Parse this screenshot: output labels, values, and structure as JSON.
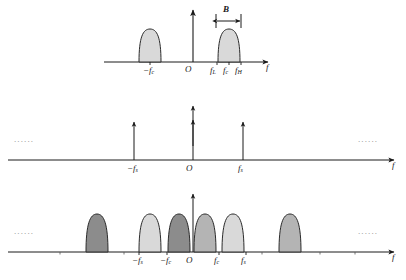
{
  "figure": {
    "axis_label": "f",
    "origin_label": "O",
    "bandwidth_label": "B",
    "ellipsis": "......",
    "colors": {
      "axis": "#1a1a1a",
      "outline": "#2b2b2b",
      "lobe_light": "#d9d9d9",
      "lobe_mid": "#b4b4b4",
      "lobe_dark": "#8c8c8c",
      "ellipsis": "#8a8a8a",
      "background": "#ffffff"
    }
  },
  "panels": [
    {
      "name": "signal-spectrum",
      "baseline_y": 62,
      "axis_from_x": 104,
      "axis_to_x": 272,
      "vaxis_x": 193,
      "vaxis_top_y": 8,
      "axis_label": "f",
      "origin_label": "O",
      "bandwidth": {
        "label": "B",
        "from_x": 216,
        "to_x": 241,
        "y": 20
      },
      "lobes": [
        {
          "name": "negative-lobe",
          "center_x": 150,
          "half_width": 11,
          "height": 33,
          "fill": "lobe_light"
        },
        {
          "name": "positive-lobe",
          "center_x": 229,
          "half_width": 11,
          "height": 33,
          "fill": "lobe_light"
        }
      ],
      "ticks": [
        {
          "name": "tick-minus-fc",
          "x": 150,
          "label": "−f",
          "sub": "c"
        },
        {
          "name": "tick-fl",
          "x": 217,
          "label": "f",
          "sub": "L"
        },
        {
          "name": "tick-fc",
          "x": 229,
          "label": "f",
          "sub": "c"
        },
        {
          "name": "tick-fh",
          "x": 241,
          "label": "f",
          "sub": "H"
        }
      ]
    },
    {
      "name": "sampling-impulse-train",
      "baseline_y": 160,
      "axis_from_x": 8,
      "axis_to_x": 398,
      "axis_label": "f",
      "origin_label": "O",
      "ellipsis_left": "......",
      "ellipsis_right": "......",
      "impulses": [
        {
          "name": "impulse-minus-fs",
          "x": 134,
          "height": 40,
          "label": "−f",
          "sub": "s"
        },
        {
          "name": "impulse-zero",
          "x": 193,
          "height": 55,
          "label": "O",
          "sub": "",
          "double_head": true
        },
        {
          "name": "impulse-fs",
          "x": 243,
          "height": 40,
          "label": "f",
          "sub": "s"
        }
      ]
    },
    {
      "name": "sampled-spectrum",
      "baseline_y": 252,
      "axis_from_x": 8,
      "axis_to_x": 398,
      "vaxis_x": 193,
      "vaxis_top_y": 192,
      "axis_label": "f",
      "origin_label": "O",
      "ellipsis_left": "......",
      "ellipsis_right": "......",
      "lobes": [
        {
          "name": "alias-lobe-1",
          "center_x": 97,
          "half_width": 11,
          "height": 38,
          "fill": "lobe_dark"
        },
        {
          "name": "alias-lobe-2",
          "center_x": 150,
          "half_width": 11,
          "height": 38,
          "fill": "lobe_light"
        },
        {
          "name": "alias-lobe-3",
          "center_x": 179,
          "half_width": 11,
          "height": 38,
          "fill": "lobe_dark"
        },
        {
          "name": "alias-lobe-4",
          "center_x": 205,
          "half_width": 11,
          "height": 38,
          "fill": "lobe_mid"
        },
        {
          "name": "alias-lobe-5",
          "center_x": 233,
          "half_width": 11,
          "height": 38,
          "fill": "lobe_light"
        },
        {
          "name": "alias-lobe-6",
          "center_x": 290,
          "half_width": 11,
          "height": 38,
          "fill": "lobe_mid"
        }
      ],
      "ticks": [
        {
          "name": "tick-minus-fs",
          "x": 139,
          "label": "−f",
          "sub": "s"
        },
        {
          "name": "tick-minus-fc",
          "x": 167,
          "label": "−f",
          "sub": "c"
        },
        {
          "name": "tick-fc",
          "x": 219,
          "label": "f",
          "sub": "c"
        },
        {
          "name": "tick-fs",
          "x": 246,
          "label": "f",
          "sub": "s"
        }
      ],
      "minor_ticks_x": [
        60,
        124,
        262,
        320,
        355
      ]
    }
  ]
}
